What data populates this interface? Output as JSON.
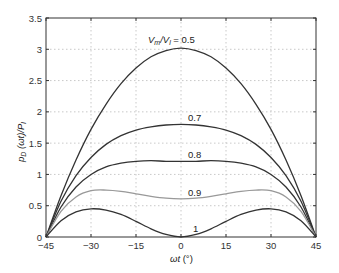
{
  "chart_data": {
    "type": "line",
    "title": "",
    "xlabel": "ωt (°)",
    "ylabel": "p_D (ωt)/P_l",
    "xlim": [
      -45,
      45
    ],
    "ylim": [
      0,
      3.5
    ],
    "grid": true,
    "legend": "inline curve labels",
    "x_ticks": [
      -45,
      -30,
      -15,
      0,
      15,
      30,
      45
    ],
    "y_ticks": [
      0,
      0.5,
      1,
      1.5,
      2,
      2.5,
      3,
      3.5
    ],
    "x_tick_labels": [
      "−45",
      "−30",
      "−15",
      "0",
      "15",
      "30",
      "45"
    ],
    "y_tick_labels": [
      "0",
      "0.5",
      "1",
      "1.5",
      "2",
      "2.5",
      "3",
      "3.5"
    ],
    "x": [
      -45,
      -40,
      -35,
      -30,
      -25,
      -20,
      -15,
      -10,
      -5,
      0,
      5,
      10,
      15,
      20,
      25,
      30,
      35,
      40,
      45
    ],
    "series": [
      {
        "name": "Vm/Vl = 0.5",
        "label": "0.5",
        "color": "#333333",
        "values": [
          0,
          0.66,
          1.23,
          1.72,
          2.12,
          2.45,
          2.7,
          2.88,
          2.98,
          3.02,
          2.98,
          2.88,
          2.7,
          2.45,
          2.12,
          1.72,
          1.23,
          0.66,
          0
        ]
      },
      {
        "name": "Vm/Vl = 0.7",
        "label": "0.7",
        "color": "#333333",
        "values": [
          0,
          0.57,
          0.98,
          1.27,
          1.48,
          1.62,
          1.71,
          1.76,
          1.79,
          1.8,
          1.79,
          1.76,
          1.71,
          1.62,
          1.48,
          1.27,
          0.98,
          0.57,
          0
        ]
      },
      {
        "name": "Vm/Vl = 0.8",
        "label": "0.8",
        "color": "#333333",
        "values": [
          0,
          0.48,
          0.8,
          1.0,
          1.12,
          1.18,
          1.21,
          1.22,
          1.21,
          1.21,
          1.21,
          1.22,
          1.21,
          1.18,
          1.12,
          1.0,
          0.8,
          0.48,
          0
        ]
      },
      {
        "name": "Vm/Vl = 0.9",
        "label": "0.9",
        "color": "#999999",
        "values": [
          0,
          0.41,
          0.64,
          0.74,
          0.75,
          0.73,
          0.69,
          0.65,
          0.62,
          0.61,
          0.62,
          0.65,
          0.69,
          0.73,
          0.75,
          0.74,
          0.64,
          0.41,
          0
        ]
      },
      {
        "name": "Vm/Vl = 1",
        "label": "1",
        "color": "#333333",
        "values": [
          0,
          0.26,
          0.4,
          0.45,
          0.43,
          0.36,
          0.25,
          0.13,
          0.04,
          0,
          0.04,
          0.13,
          0.25,
          0.36,
          0.43,
          0.45,
          0.4,
          0.26,
          0
        ]
      }
    ],
    "annotations": [
      {
        "text": "Vm/Vl = 0.5",
        "x": 0,
        "y": 3.18
      },
      {
        "text": "0.7",
        "x": 0,
        "y": 1.88
      },
      {
        "text": "0.8",
        "x": 0,
        "y": 1.29
      },
      {
        "text": "0.9",
        "x": 0,
        "y": 0.69
      },
      {
        "text": "1",
        "x": 5,
        "y": 0.1
      }
    ]
  },
  "labels": {
    "first_curve_prefix_V": "V",
    "first_curve_sub_m": "m",
    "first_curve_slash": "/V",
    "first_curve_sub_l": "l",
    "first_curve_value": " = 0.5",
    "c07": "0.7",
    "c08": "0.8",
    "c09": "0.9",
    "c1": "1",
    "xlabel_omega_t": "ωt",
    "xlabel_unit": " (°)",
    "ylabel_p": "p",
    "ylabel_sub_D": "D",
    "ylabel_mid": " (ωt)/P",
    "ylabel_sub_l": "l"
  }
}
